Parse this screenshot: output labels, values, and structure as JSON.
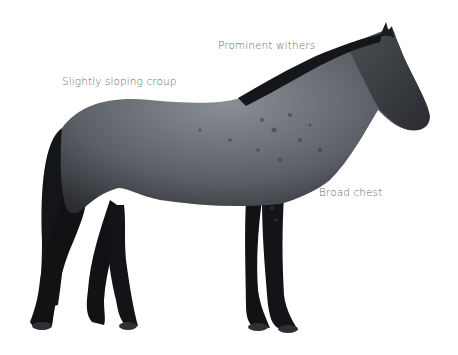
{
  "diagram": {
    "labels": {
      "withers": "Prominent withers",
      "croup": "Slightly sloping croup",
      "chest": "Broad chest"
    },
    "colors": {
      "background": "#ffffff",
      "coat_light": "#8a8f96",
      "coat_dark": "#2a2c30",
      "legs": "#111214",
      "label_text": "#6a6a6a"
    }
  }
}
